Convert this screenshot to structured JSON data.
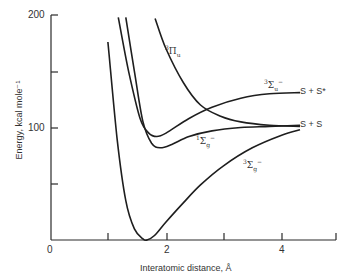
{
  "chart_data": {
    "type": "line",
    "title": "",
    "xlabel": "Interatomic distance, Å",
    "ylabel": "Energy, kcal mole⁻¹",
    "xlim": [
      0,
      4.9
    ],
    "ylim": [
      0,
      200
    ],
    "x_ticks": [
      1,
      2,
      3,
      4
    ],
    "x_tick_labels": [
      "0",
      "2",
      "4"
    ],
    "y_ticks": [
      50,
      100,
      150,
      200
    ],
    "y_tick_labels": [
      "100",
      "200"
    ],
    "grid": false,
    "legend": "none (curves labeled inline)",
    "series": [
      {
        "name": "³Σg⁻",
        "label_pos": [
          3.5,
          78
        ],
        "points": [
          [
            0.99,
            176
          ],
          [
            1.15,
            90
          ],
          [
            1.3,
            35
          ],
          [
            1.45,
            10
          ],
          [
            1.6,
            1
          ],
          [
            1.67,
            0
          ],
          [
            1.8,
            4
          ],
          [
            2.0,
            16
          ],
          [
            2.3,
            33
          ],
          [
            2.6,
            49
          ],
          [
            3.0,
            66
          ],
          [
            3.5,
            82
          ],
          [
            4.0,
            93
          ],
          [
            4.33,
            98
          ]
        ]
      },
      {
        "name": "¹Σg⁻",
        "label_pos": [
          2.35,
          75
        ],
        "points": [
          [
            1.3,
            198
          ],
          [
            1.45,
            150
          ],
          [
            1.6,
            105
          ],
          [
            1.75,
            86
          ],
          [
            1.9,
            82
          ],
          [
            2.1,
            85
          ],
          [
            2.4,
            92
          ],
          [
            2.8,
            97
          ],
          [
            3.3,
            100
          ],
          [
            3.8,
            101
          ],
          [
            4.33,
            102
          ]
        ]
      },
      {
        "name": "³Σu⁻",
        "label_pos": [
          3.4,
          140
        ],
        "points": [
          [
            1.17,
            198
          ],
          [
            1.35,
            150
          ],
          [
            1.55,
            108
          ],
          [
            1.7,
            95
          ],
          [
            1.84,
            92
          ],
          [
            2.0,
            95
          ],
          [
            2.4,
            108
          ],
          [
            2.8,
            118
          ],
          [
            3.3,
            126
          ],
          [
            3.8,
            130
          ],
          [
            4.33,
            131
          ]
        ]
      },
      {
        "name": "³Πu",
        "label_pos": [
          2.05,
          150
        ],
        "points": [
          [
            1.81,
            197
          ],
          [
            2.0,
            170
          ],
          [
            2.3,
            140
          ],
          [
            2.6,
            120
          ],
          [
            2.95,
            110
          ],
          [
            3.3,
            105
          ],
          [
            3.8,
            102
          ],
          [
            4.33,
            101
          ]
        ]
      }
    ],
    "annotations": [
      {
        "text": "S + S*",
        "x": 4.35,
        "y": 131
      },
      {
        "text": "S + S",
        "x": 4.35,
        "y": 102
      }
    ]
  },
  "axes": {
    "ylabel": "Energy, kcal mole⁻¹",
    "xlabel": "Interatomic distance, Å",
    "y_tick_200": "200",
    "y_tick_100": "100",
    "x_tick_0": "0",
    "x_tick_2": "2",
    "x_tick_4": "4"
  },
  "labels": {
    "pi_u": {
      "base": "Π",
      "sup": "3",
      "sub": "u"
    },
    "sigma_u_minus": {
      "base": "Σ",
      "sup": "3",
      "sub": "u",
      "sup2": "−"
    },
    "sigma_g_singlet": {
      "base": "Σ",
      "sup": "1",
      "sub": "g",
      "sup2": "−"
    },
    "sigma_g_triplet": {
      "base": "Σ",
      "sup": "3",
      "sub": "g",
      "sup2": "−"
    },
    "asym_excited": "S + S*",
    "asym_ground": "S + S"
  }
}
